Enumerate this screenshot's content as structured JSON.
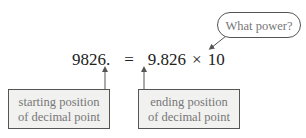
{
  "equation": {
    "left": "9826.",
    "equals": "=",
    "mantissa": "9.826",
    "times": "×",
    "base": "10"
  },
  "callouts": {
    "bubble": "What power?",
    "start_box": {
      "line1": "starting position",
      "line2": "of decimal point"
    },
    "end_box": {
      "line1": "ending position",
      "line2": "of decimal point"
    }
  },
  "colors": {
    "box_fill": "#f1f1f0",
    "box_text": "#777777",
    "stroke": "#555555",
    "equation_text": "#222222"
  }
}
